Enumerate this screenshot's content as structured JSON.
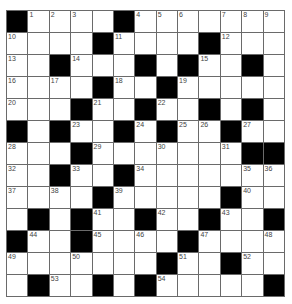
{
  "puzzle": {
    "rows": 13,
    "cols": 13,
    "colors": {
      "block": "#000000",
      "cell": "#ffffff",
      "gridline": "#6a6a6a",
      "number": "#444444"
    },
    "grid": [
      [
        "#",
        "1",
        "2",
        "3",
        ".",
        "#",
        "4",
        "5",
        "6",
        ".",
        "7",
        "8",
        "9"
      ],
      [
        "10",
        ".",
        ".",
        ".",
        "#",
        "11",
        ".",
        ".",
        ".",
        "#",
        "12",
        ".",
        "."
      ],
      [
        "13",
        ".",
        "#",
        "14",
        ".",
        ".",
        "#",
        ".",
        "#",
        "15",
        ".",
        "#",
        "."
      ],
      [
        "16",
        ".",
        "17",
        ".",
        "#",
        "18",
        ".",
        "#",
        "19",
        ".",
        ".",
        ".",
        "."
      ],
      [
        "20",
        ".",
        ".",
        "#",
        "21",
        ".",
        "#",
        "22",
        ".",
        "#",
        ".",
        "#",
        "."
      ],
      [
        "#",
        ".",
        "#",
        "23",
        ".",
        "#",
        "24",
        "#",
        "25",
        "26",
        "#",
        "27",
        "."
      ],
      [
        "28",
        ".",
        ".",
        "#",
        "29",
        ".",
        ".",
        "30",
        ".",
        ".",
        "31",
        "#",
        "#"
      ],
      [
        "32",
        ".",
        "#",
        "33",
        ".",
        "#",
        "34",
        ".",
        ".",
        ".",
        ".",
        "35",
        "36"
      ],
      [
        "37",
        ".",
        "38",
        ".",
        "#",
        "39",
        ".",
        ".",
        ".",
        ".",
        "#",
        "40",
        "."
      ],
      [
        ".",
        "#",
        ".",
        "#",
        "41",
        ".",
        "#",
        "42",
        ".",
        "#",
        "43",
        ".",
        "#"
      ],
      [
        "#",
        "44",
        ".",
        "#",
        "45",
        ".",
        "46",
        ".",
        "#",
        "47",
        ".",
        ".",
        "48"
      ],
      [
        "49",
        ".",
        ".",
        "50",
        ".",
        ".",
        ".",
        "#",
        "51",
        ".",
        "#",
        "52",
        "."
      ],
      [
        ".",
        "#",
        "53",
        ".",
        "#",
        ".",
        "#",
        "54",
        ".",
        ".",
        ".",
        ".",
        "#"
      ]
    ]
  }
}
